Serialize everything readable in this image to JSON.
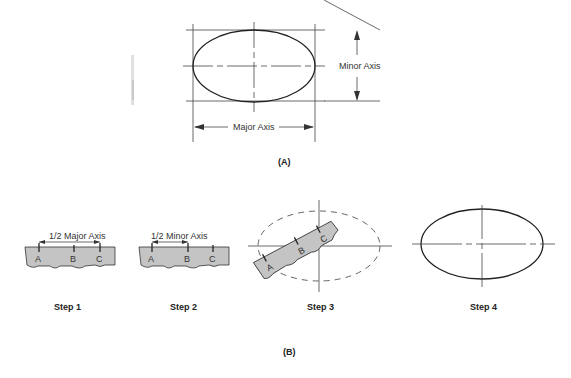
{
  "figure_a": {
    "caption": "(A)",
    "minor_axis_label": "Minor Axis",
    "major_axis_label": "Major Axis"
  },
  "figure_b": {
    "caption": "(B)",
    "steps": [
      {
        "label": "Step 1",
        "dimension_label": "1/2 Major Axis",
        "marks": [
          "A",
          "B",
          "C"
        ]
      },
      {
        "label": "Step 2",
        "dimension_label": "1/2 Minor Axis",
        "marks": [
          "A",
          "B",
          "C"
        ]
      },
      {
        "label": "Step 3",
        "marks": [
          "A",
          "B",
          "C"
        ]
      },
      {
        "label": "Step 4"
      }
    ]
  },
  "colors": {
    "ruler_fill": "#c4c4c4",
    "line": "#333333",
    "background": "#ffffff"
  }
}
